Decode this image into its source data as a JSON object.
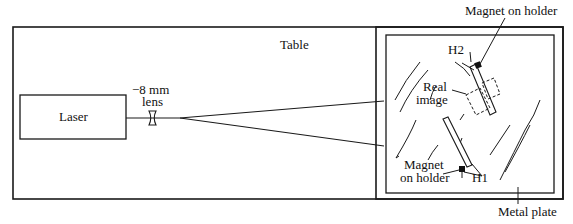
{
  "diagram": {
    "title_label": "Table",
    "laser_label": "Laser",
    "lens_label_line1": "−8 mm",
    "lens_label_line2": "lens",
    "real_image_line1": "Real",
    "real_image_line2": "image",
    "magnet_top_label": "Magnet on holder",
    "magnet_bottom_line1": "Magnet",
    "magnet_bottom_line2": "on holder",
    "h1_label": "H1",
    "h2_label": "H2",
    "metal_plate_label": "Metal plate"
  },
  "colors": {
    "stroke": "#1a1a1a",
    "background": "#ffffff"
  }
}
